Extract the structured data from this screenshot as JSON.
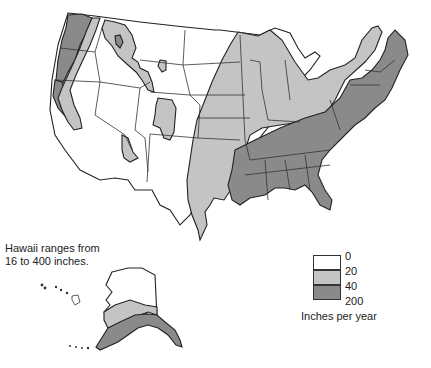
{
  "map": {
    "title": "Average annual precipitation, United States",
    "note": "Hawaii ranges from 16 to 400 inches.",
    "note_lines": [
      "Hawaii ranges from",
      "16 to 400 inches."
    ],
    "legend": {
      "title": "Inches per year",
      "ticks": [
        "0",
        "20",
        "40",
        "200"
      ],
      "classes": [
        {
          "range": "0–20",
          "color": "#ffffff"
        },
        {
          "range": "20–40",
          "color": "#c4c4c4"
        },
        {
          "range": "40–200",
          "color": "#8a8a8a"
        }
      ]
    },
    "regions": [
      {
        "name": "Pacific Northwest coast",
        "class": "40–200"
      },
      {
        "name": "Northern California coast",
        "class": "40–200"
      },
      {
        "name": "Cascades / Sierra fringe",
        "class": "20–40"
      },
      {
        "name": "Northern Rockies",
        "class": "20–40"
      },
      {
        "name": "Colorado Rockies",
        "class": "20–40"
      },
      {
        "name": "Utah highlands",
        "class": "20–40"
      },
      {
        "name": "Great Plains & West interior",
        "class": "0–20"
      },
      {
        "name": "Midwest & eastern plains",
        "class": "20–40"
      },
      {
        "name": "Southeast & Appalachians",
        "class": "40–200"
      },
      {
        "name": "Northeast & New England",
        "class": "40–200"
      },
      {
        "name": "Alaska interior / north",
        "class": "0–20"
      },
      {
        "name": "Alaska south-central",
        "class": "20–40"
      },
      {
        "name": "Alaska south coast & panhandle",
        "class": "40–200"
      }
    ],
    "colors": {
      "dry": "#ffffff",
      "moderate": "#c4c4c4",
      "wet": "#8a8a8a",
      "outline": "#222222"
    }
  }
}
